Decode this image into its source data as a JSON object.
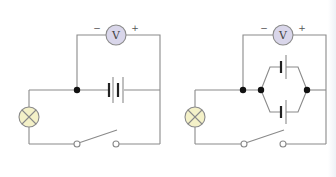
{
  "diagram": {
    "type": "circuit-schematic",
    "colors": {
      "wire": "#8a8a8a",
      "junction": "#111111",
      "voltmeter_fill": "#d9d6ea",
      "voltmeter_stroke": "#8a8a8a",
      "lamp_fill": "#f4f1c8",
      "cell_long": "#8a8a8a",
      "cell_short": "#222222"
    },
    "circuits": [
      {
        "id": "single-cell-circuit",
        "voltmeter": {
          "label": "V",
          "minus": "−",
          "plus": "+"
        },
        "battery": "two cells in series",
        "lamp": "bulb",
        "switch": "open"
      },
      {
        "id": "parallel-cell-circuit",
        "voltmeter": {
          "label": "V",
          "minus": "−",
          "plus": "+"
        },
        "battery": "two cells in parallel",
        "lamp": "bulb",
        "switch": "open"
      }
    ]
  }
}
